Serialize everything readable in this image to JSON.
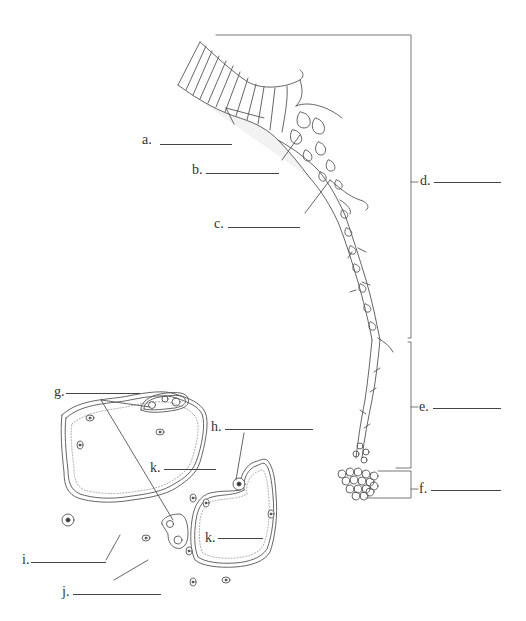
{
  "diagram": {
    "stroke_color": "#555555",
    "fill_color": "#f2f2f2",
    "labels": [
      {
        "id": "a",
        "text": "a."
      },
      {
        "id": "b",
        "text": "b."
      },
      {
        "id": "c",
        "text": "c."
      },
      {
        "id": "d",
        "text": "d."
      },
      {
        "id": "e",
        "text": "e."
      },
      {
        "id": "f",
        "text": "f."
      },
      {
        "id": "g",
        "text": "g."
      },
      {
        "id": "h",
        "text": "h."
      },
      {
        "id": "i",
        "text": "i."
      },
      {
        "id": "j",
        "text": "j."
      },
      {
        "id": "k1",
        "text": "k."
      },
      {
        "id": "k2",
        "text": "k."
      }
    ],
    "brackets": [
      "d",
      "e",
      "f"
    ]
  }
}
